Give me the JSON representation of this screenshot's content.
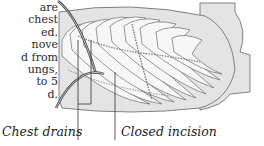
{
  "body_text": {
    "lines": [
      "are",
      "chest",
      "ed.",
      "nove",
      "d from",
      "ungs,",
      "to 5",
      "d."
    ]
  },
  "figure": {
    "labels": {
      "chest_drains": "Chest drains",
      "closed_incision": "Closed incision"
    },
    "colors": {
      "panel_fill": "#e4e4e4",
      "outline": "#555555",
      "rib_fill": "#f6f6f6",
      "background": "#ffffff"
    }
  }
}
